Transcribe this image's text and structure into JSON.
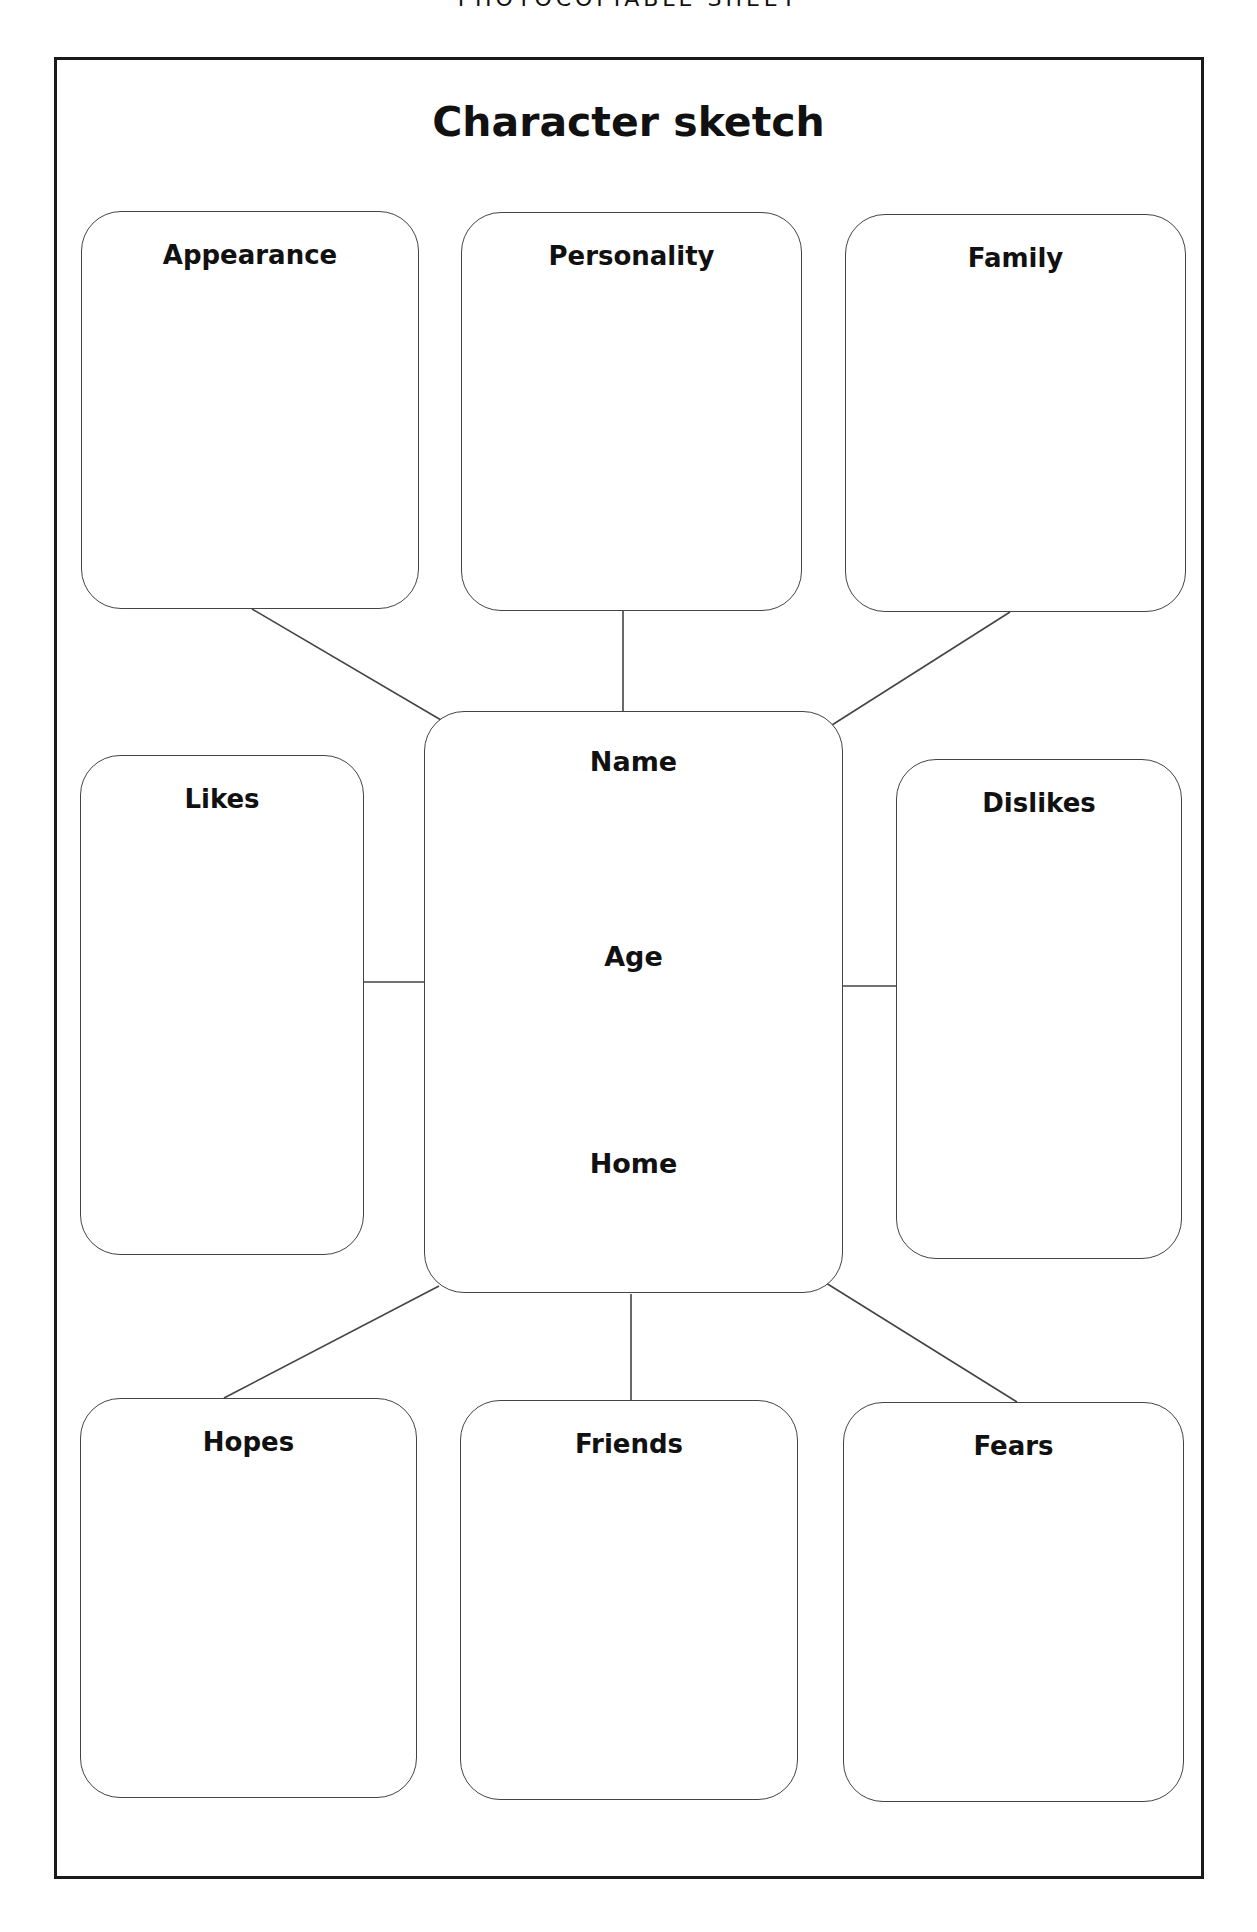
{
  "header": {
    "text": "PHOTOCOPIABLE SHEET"
  },
  "title": "Character sketch",
  "boxes": {
    "appearance": "Appearance",
    "personality": "Personality",
    "family": "Family",
    "likes": "Likes",
    "dislikes": "Dislikes",
    "hopes": "Hopes",
    "friends": "Friends",
    "fears": "Fears"
  },
  "center": {
    "name": "Name",
    "age": "Age",
    "home": "Home"
  },
  "colors": {
    "line": "#444444",
    "frame": "#1a1a1a",
    "text": "#111111"
  }
}
